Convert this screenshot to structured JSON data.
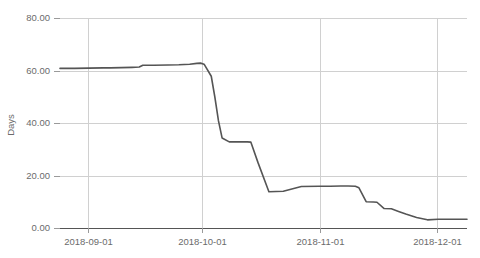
{
  "chart_data": {
    "type": "line",
    "title": "",
    "subtitle": "",
    "xlabel": "",
    "ylabel": "Days",
    "xlim": [
      "2018-08-18",
      "2018-12-09"
    ],
    "ylim": [
      0,
      80
    ],
    "grid": true,
    "legend": false,
    "legend_position": "none",
    "y_ticks": [
      0,
      20,
      40,
      60,
      80
    ],
    "y_tick_labels": [
      "0.00",
      "20.00",
      "40.00",
      "60.00",
      "80.00"
    ],
    "x_ticks": [
      "2018-09-01",
      "2018-10-01",
      "2018-11-01",
      "2018-12-01"
    ],
    "x_tick_labels": [
      "2018-09-01",
      "2018-10-01",
      "2018-11-01",
      "2018-12-01"
    ],
    "line_color": "#555555",
    "grid_color": "#d0d0d0",
    "axis_color": "#555555",
    "tick_label_color": "#6b6b6b",
    "series": [
      {
        "name": "Days",
        "x": [
          "2018-08-18",
          "2018-08-22",
          "2018-08-26",
          "2018-08-30",
          "2018-09-01",
          "2018-09-04",
          "2018-09-07",
          "2018-09-09",
          "2018-09-10",
          "2018-09-13",
          "2018-09-17",
          "2018-09-20",
          "2018-09-23",
          "2018-09-25",
          "2018-09-26",
          "2018-09-27",
          "2018-09-29",
          "2018-09-30",
          "2018-10-01",
          "2018-10-02",
          "2018-10-04",
          "2018-10-06",
          "2018-10-07",
          "2018-10-08",
          "2018-10-09",
          "2018-10-10",
          "2018-10-12",
          "2018-10-15",
          "2018-10-19",
          "2018-10-24",
          "2018-10-29",
          "2018-11-01",
          "2018-11-04",
          "2018-11-06",
          "2018-11-08",
          "2018-11-09",
          "2018-11-11",
          "2018-11-13",
          "2018-11-14",
          "2018-11-16",
          "2018-11-18",
          "2018-11-20",
          "2018-11-22",
          "2018-11-25",
          "2018-11-28",
          "2018-12-01",
          "2018-12-05",
          "2018-12-09"
        ],
        "y": [
          61.0,
          61.0,
          61.1,
          61.2,
          61.2,
          61.3,
          61.4,
          61.5,
          62.2,
          62.2,
          62.3,
          62.4,
          62.6,
          62.9,
          63.0,
          62.6,
          58.0,
          50.0,
          41.0,
          34.5,
          33.0,
          33.0,
          33.0,
          33.0,
          33.0,
          32.9,
          25.0,
          14.0,
          14.2,
          16.0,
          16.1,
          16.1,
          16.2,
          16.2,
          16.1,
          15.5,
          10.2,
          10.1,
          10.0,
          7.6,
          7.5,
          6.5,
          5.5,
          4.2,
          3.3,
          3.5,
          3.5,
          3.5
        ]
      }
    ]
  },
  "axis": {
    "y_title": "Days"
  }
}
